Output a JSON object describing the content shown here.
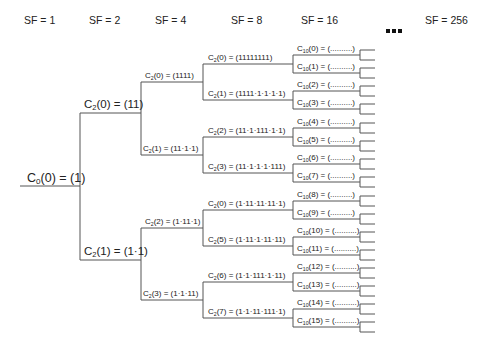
{
  "headers": {
    "sf1": "SF = 1",
    "sf2": "SF = 2",
    "sf4": "SF = 4",
    "sf8": "SF = 8",
    "sf16": "SF = 16",
    "ellipsis": "■■■",
    "sf256": "SF = 256"
  },
  "root": {
    "name": "C",
    "sub": "0",
    "rest": "(0) = (1)"
  },
  "sf2": [
    {
      "name": "C",
      "sub": "2",
      "rest": "(0) = (11)"
    },
    {
      "name": "C",
      "sub": "2",
      "rest": "(1) = (1·1)"
    }
  ],
  "sf4": [
    {
      "name": "C",
      "sub": "2",
      "rest": "(0) = (1111)"
    },
    {
      "name": "C",
      "sub": "2",
      "rest": "(1) = (11·1·1)"
    },
    {
      "name": "C",
      "sub": "2",
      "rest": "(2) = (1·11·1)"
    },
    {
      "name": "C",
      "sub": "2",
      "rest": "(3) = (1·1·11)"
    }
  ],
  "sf8": [
    {
      "name": "C",
      "sub": "2",
      "rest": "(0) = (11111111)"
    },
    {
      "name": "C",
      "sub": "2",
      "rest": "(1) = (1111·1·1·1·1)"
    },
    {
      "name": "C",
      "sub": "2",
      "rest": "(2) = (11·1·111·1·1)"
    },
    {
      "name": "C",
      "sub": "2",
      "rest": "(3) = (11·1·1·1·111)"
    },
    {
      "name": "C",
      "sub": "2",
      "rest": "(0) = (1·11·11·11·1)"
    },
    {
      "name": "C",
      "sub": "2",
      "rest": "(5) = (1·11·1·11·11)"
    },
    {
      "name": "C",
      "sub": "2",
      "rest": "(6) = (1·1·111·1·11)"
    },
    {
      "name": "C",
      "sub": "2",
      "rest": "(7) = (1·1·11·111·1)"
    }
  ],
  "sf16": [
    {
      "name": "C",
      "sub": "10",
      "rest": "(0) = (..........)"
    },
    {
      "name": "C",
      "sub": "10",
      "rest": "(1) = (..........)"
    },
    {
      "name": "C",
      "sub": "10",
      "rest": "(2) = (..........)"
    },
    {
      "name": "C",
      "sub": "10",
      "rest": "(3) = (..........)"
    },
    {
      "name": "C",
      "sub": "10",
      "rest": "(4) = (..........)"
    },
    {
      "name": "C",
      "sub": "10",
      "rest": "(5) = (..........)"
    },
    {
      "name": "C",
      "sub": "10",
      "rest": "(6) = (..........)"
    },
    {
      "name": "C",
      "sub": "10",
      "rest": "(7) = (..........)"
    },
    {
      "name": "C",
      "sub": "10",
      "rest": "(8) = (..........)"
    },
    {
      "name": "C",
      "sub": "10",
      "rest": "(9) = (..........)"
    },
    {
      "name": "C",
      "sub": "10",
      "rest": "(10) = (..........)"
    },
    {
      "name": "C",
      "sub": "10",
      "rest": "(11) = (..........)"
    },
    {
      "name": "C",
      "sub": "10",
      "rest": "(12) = (..........)"
    },
    {
      "name": "C",
      "sub": "10",
      "rest": "(13) = (..........)"
    },
    {
      "name": "C",
      "sub": "10",
      "rest": "(14) = (..........)"
    },
    {
      "name": "C",
      "sub": "10",
      "rest": "(15) = (..........)"
    }
  ],
  "colors": {
    "line": "#555555",
    "text": "#222222"
  }
}
